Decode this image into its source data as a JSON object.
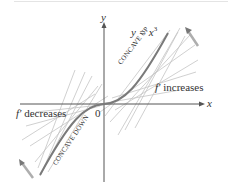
{
  "figure": {
    "axes": {
      "x_label": "x",
      "y_label": "y",
      "origin_label": "0"
    },
    "curve": {
      "equation_prefix": "y = ",
      "equation_var": "x",
      "equation_exp": "3"
    },
    "annotations": {
      "concave_up": "CONCAVE UP",
      "concave_down": "CONCAVE DOWN",
      "right_prime": "f′",
      "right_text": "increases",
      "left_prime": "f′",
      "left_text": "decreases"
    },
    "colors": {
      "axis": "#555555",
      "curve": "#7a7a7a",
      "tangent": "#bdbdbd",
      "text": "#333333"
    }
  }
}
